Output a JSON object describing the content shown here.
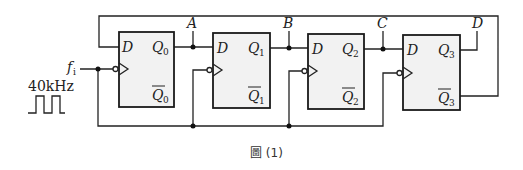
{
  "figure": {
    "caption": "圖 (1)",
    "clock_input": {
      "label": "f",
      "subscript": "i",
      "frequency": "40kHz"
    },
    "nodes": [
      {
        "id": "A",
        "label": "A"
      },
      {
        "id": "B",
        "label": "B"
      },
      {
        "id": "C",
        "label": "C"
      },
      {
        "id": "D",
        "label": "D"
      }
    ],
    "flipflops": [
      {
        "name": "FF0",
        "d": "D",
        "q": "Q",
        "qbar": "Q",
        "sub": "0"
      },
      {
        "name": "FF1",
        "d": "D",
        "q": "Q",
        "qbar": "Q",
        "sub": "1"
      },
      {
        "name": "FF2",
        "d": "D",
        "q": "Q",
        "qbar": "Q",
        "sub": "2"
      },
      {
        "name": "FF3",
        "d": "D",
        "q": "Q",
        "qbar": "Q",
        "sub": "3"
      }
    ],
    "colors": {
      "wire": "#222222",
      "box_fill": "#f2f2f2",
      "box_stroke": "#1a1a1a"
    }
  }
}
